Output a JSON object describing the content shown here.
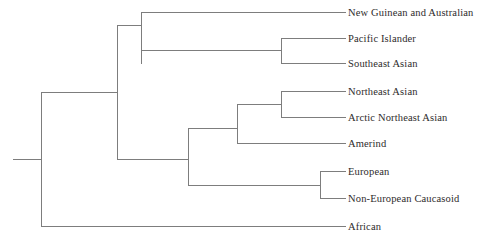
{
  "figure": {
    "type": "dendrogram",
    "background_color": "#ffffff",
    "line_color": "#7d7d7d",
    "line_width": 1,
    "text_color": "#2e2b2b",
    "width": 486,
    "height": 243
  },
  "chart_data": {
    "type": "tree",
    "title": "",
    "xlabel": "",
    "ylabel": "",
    "grid": false,
    "legend": null,
    "leaf_label_x": 348,
    "leaves": [
      {
        "name": "New Guinean and Australian",
        "y": 12,
        "tip_x": 345,
        "branch_x": 141
      },
      {
        "name": "Pacific Islander",
        "y": 38,
        "tip_x": 345,
        "branch_x": 281
      },
      {
        "name": "Southeast Asian",
        "y": 63,
        "tip_x": 345,
        "branch_x": 281
      },
      {
        "name": "Northeast Asian",
        "y": 91,
        "tip_x": 345,
        "branch_x": 281
      },
      {
        "name": "Arctic Northeast Asian",
        "y": 117,
        "tip_x": 345,
        "branch_x": 281
      },
      {
        "name": "Amerind",
        "y": 143,
        "tip_x": 345,
        "branch_x": 237
      },
      {
        "name": "European",
        "y": 171,
        "tip_x": 345,
        "branch_x": 320
      },
      {
        "name": "Non-European Caucasoid",
        "y": 198,
        "tip_x": 345,
        "branch_x": 320
      },
      {
        "name": "African",
        "y": 226,
        "tip_x": 345,
        "branch_x": 41
      }
    ],
    "nodes": [
      {
        "id": "root",
        "x": 41,
        "y_top": 92,
        "y_bottom": 226,
        "parent_x": 13,
        "y": 159
      },
      {
        "id": "non-african",
        "x": 117,
        "y_top": 25,
        "y_bottom": 159,
        "parent_x": 41,
        "y": 92
      },
      {
        "id": "oceanic-clade",
        "x": 141,
        "y_top": 12,
        "y_bottom": 63,
        "parent_x": 117,
        "y": 25
      },
      {
        "id": "pacific-se-asian",
        "x": 281,
        "y_top": 38,
        "y_bottom": 63,
        "parent_x": 141,
        "y": 50
      },
      {
        "id": "eurasian-amerind",
        "x": 188,
        "y_top": 128,
        "y_bottom": 185,
        "parent_x": 117,
        "y": 159
      },
      {
        "id": "ne-asian-amerind",
        "x": 237,
        "y_top": 104,
        "y_bottom": 143,
        "parent_x": 188,
        "y": 128
      },
      {
        "id": "ne-arctic-asian",
        "x": 281,
        "y_top": 91,
        "y_bottom": 117,
        "parent_x": 237,
        "y": 104
      },
      {
        "id": "caucasoid",
        "x": 320,
        "y_top": 171,
        "y_bottom": 198,
        "parent_x": 188,
        "y": 185
      }
    ]
  }
}
